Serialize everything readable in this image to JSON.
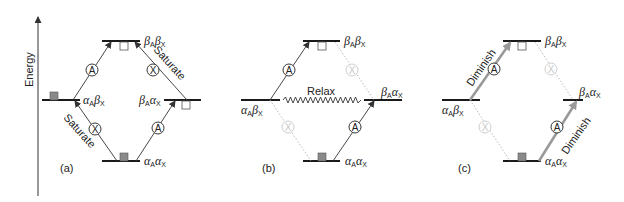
{
  "axis": {
    "label": "Energy"
  },
  "states": {
    "bb": {
      "g1": "β",
      "s1": "A",
      "g2": "β",
      "s2": "X"
    },
    "ab": {
      "g1": "α",
      "s1": "A",
      "g2": "β",
      "s2": "X"
    },
    "ba": {
      "g1": "β",
      "s1": "A",
      "g2": "α",
      "s2": "X"
    },
    "aa": {
      "g1": "α",
      "s1": "A",
      "g2": "α",
      "s2": "X"
    }
  },
  "transitions": {
    "A": "A",
    "X": "X"
  },
  "panels": [
    {
      "id": "a",
      "label": "(a)",
      "annotations": [
        "Saturate",
        "Saturate"
      ]
    },
    {
      "id": "b",
      "label": "(b)",
      "annotations": [
        "Relax"
      ]
    },
    {
      "id": "c",
      "label": "(c)",
      "annotations": [
        "Diminish",
        "Diminish"
      ]
    }
  ],
  "colors": {
    "level": "#1a1a1a",
    "filled_population": "#8a8a8a",
    "faded": "#c8c8c8",
    "enhanced_arrow": "#9a9a9a"
  }
}
